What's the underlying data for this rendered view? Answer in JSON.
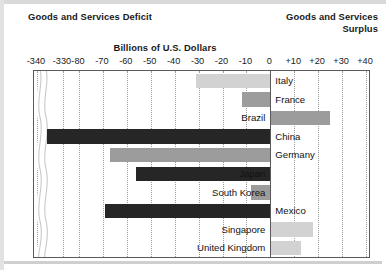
{
  "header": {
    "deficit_title": "Goods and Services Deficit",
    "surplus_title_line1": "Goods and Services",
    "surplus_title_line2": "Surplus",
    "units_title": "Billions of U.S. Dollars"
  },
  "chart_data": {
    "type": "bar",
    "orientation": "horizontal",
    "title": "Billions of U.S. Dollars",
    "xlabel": "Billions of U.S. Dollars",
    "ylabel": "",
    "grid": true,
    "legend": "none",
    "axis_break": true,
    "axis_break_between": [
      -330,
      -80
    ],
    "xlim": [
      -340,
      40
    ],
    "tick_labels": [
      "-340",
      "-330",
      "-80",
      "-70",
      "-60",
      "-50",
      "-40",
      "-30",
      "-20",
      "-10",
      "0",
      "+10",
      "+20",
      "+30",
      "+40"
    ],
    "tick_values": [
      -340,
      -330,
      -80,
      -70,
      -60,
      -50,
      -40,
      -30,
      -20,
      -10,
      0,
      10,
      20,
      30,
      40
    ],
    "categories": [
      "Italy",
      "France",
      "Brazil",
      "China",
      "Germany",
      "Japan",
      "South Korea",
      "Mexico",
      "Singapore",
      "United Kingdom"
    ],
    "values": [
      -31,
      -12,
      25,
      -336,
      -67,
      -56,
      -8,
      -69,
      18,
      13
    ],
    "bars": [
      {
        "label": "Italy",
        "value": -31,
        "shade": "light",
        "label_side": "right"
      },
      {
        "label": "France",
        "value": -12,
        "shade": "mid",
        "label_side": "right"
      },
      {
        "label": "Brazil",
        "value": 25,
        "shade": "mid",
        "label_side": "left"
      },
      {
        "label": "China",
        "value": -336,
        "shade": "dark",
        "label_side": "right"
      },
      {
        "label": "Germany",
        "value": -67,
        "shade": "mid",
        "label_side": "right"
      },
      {
        "label": "Japan",
        "value": -56,
        "shade": "dark",
        "label_side": "left"
      },
      {
        "label": "South Korea",
        "value": -8,
        "shade": "mid",
        "label_side": "left"
      },
      {
        "label": "Mexico",
        "value": -69,
        "shade": "dark",
        "label_side": "right"
      },
      {
        "label": "Singapore",
        "value": 18,
        "shade": "light",
        "label_side": "left"
      },
      {
        "label": "United Kingdom",
        "value": 13,
        "shade": "light",
        "label_side": "left"
      }
    ],
    "colors": {
      "dark": "#262626",
      "mid": "#9c9c9c",
      "light": "#d2d2d2",
      "frame": "#5a5a5a",
      "grid": "#9a9a9a"
    }
  }
}
